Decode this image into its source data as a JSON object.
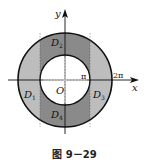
{
  "figure": {
    "caption": "图 9－29",
    "labels": {
      "y_axis": "y",
      "x_axis": "x",
      "origin": "O",
      "pi": "π",
      "two_pi": "2π",
      "d1": "D",
      "d1_sub": "1",
      "d2": "D",
      "d2_sub": "2",
      "d3": "D",
      "d3_sub": "3",
      "d4": "D",
      "d4_sub": "4"
    },
    "colors": {
      "dark_region": "#8a8a8a",
      "light_region": "#bdbdbd",
      "outline": "#111111",
      "background": "#ffffff"
    }
  }
}
